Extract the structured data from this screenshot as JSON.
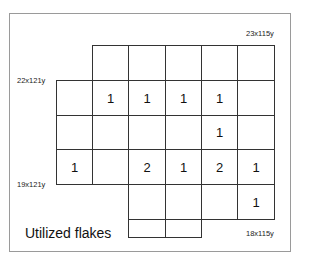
{
  "diagram": {
    "title": "Utilized flakes",
    "corner_labels": {
      "top_right": "23x115y",
      "top_left": "22x121y",
      "bottom_left": "19x121y",
      "bottom_right": "18x115y"
    },
    "grid": {
      "rows": [
        [
          "",
          "",
          "",
          "",
          "",
          null
        ],
        [
          null,
          "1",
          "1",
          "1",
          "1",
          null
        ],
        [
          null,
          "",
          "",
          "",
          "1",
          null
        ],
        [
          null,
          "1",
          "",
          "2",
          "1",
          "2"
        ],
        [
          null,
          null,
          null,
          "",
          "",
          "1"
        ]
      ]
    },
    "cells": [
      {
        "r": 0,
        "c": 1,
        "v": ""
      },
      {
        "r": 0,
        "c": 2,
        "v": ""
      },
      {
        "r": 0,
        "c": 3,
        "v": ""
      },
      {
        "r": 0,
        "c": 4,
        "v": ""
      },
      {
        "r": 0,
        "c": 5,
        "v": ""
      },
      {
        "r": 1,
        "c": 0,
        "v": ""
      },
      {
        "r": 1,
        "c": 1,
        "v": "1"
      },
      {
        "r": 1,
        "c": 2,
        "v": "1"
      },
      {
        "r": 1,
        "c": 3,
        "v": "1"
      },
      {
        "r": 1,
        "c": 4,
        "v": "1"
      },
      {
        "r": 1,
        "c": 5,
        "v": ""
      },
      {
        "r": 2,
        "c": 0,
        "v": ""
      },
      {
        "r": 2,
        "c": 1,
        "v": ""
      },
      {
        "r": 2,
        "c": 2,
        "v": ""
      },
      {
        "r": 2,
        "c": 3,
        "v": ""
      },
      {
        "r": 2,
        "c": 4,
        "v": "1"
      },
      {
        "r": 2,
        "c": 5,
        "v": ""
      },
      {
        "r": 3,
        "c": 0,
        "v": "1"
      },
      {
        "r": 3,
        "c": 1,
        "v": ""
      },
      {
        "r": 3,
        "c": 2,
        "v": "2"
      },
      {
        "r": 3,
        "c": 3,
        "v": "1"
      },
      {
        "r": 3,
        "c": 4,
        "v": "2"
      },
      {
        "r": 3,
        "c": 5,
        "v": "1"
      },
      {
        "r": 4,
        "c": 2,
        "v": ""
      },
      {
        "r": 4,
        "c": 3,
        "v": ""
      },
      {
        "r": 4,
        "c": 4,
        "v": ""
      },
      {
        "r": 4,
        "c": 5,
        "v": "1"
      }
    ],
    "partial_cells": [
      {
        "c": 2,
        "v": ""
      },
      {
        "c": 3,
        "v": ""
      }
    ]
  }
}
